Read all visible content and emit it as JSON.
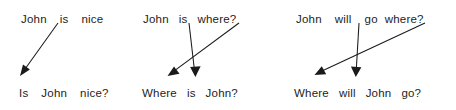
{
  "diagram": {
    "background_color": "#ffffff",
    "ink_color": "#1a1a1a",
    "groups": [
      {
        "id": "group-1",
        "transformation": "subject-auxiliary inversion",
        "source": {
          "full": "John is nice",
          "words": [
            "John",
            "is",
            "nice"
          ]
        },
        "target": {
          "full": "Is John nice?",
          "words": [
            "Is",
            "John",
            "nice?"
          ]
        },
        "arrows": [
          {
            "id": "g1-arrow-aux",
            "label": "is-to-front",
            "from_word": "is",
            "to_word": "Is",
            "from": [
              58,
              23
            ],
            "to": [
              21,
              74
            ]
          }
        ]
      },
      {
        "id": "group-2",
        "transformation": "wh-movement and subject-auxiliary inversion",
        "source": {
          "full": "John is where?",
          "words": [
            "John",
            "is",
            "where?"
          ]
        },
        "target": {
          "full": "Where is John?",
          "words": [
            "Where",
            "is",
            "John?"
          ]
        },
        "arrows": [
          {
            "id": "g2-arrow-aux",
            "label": "is-to-second",
            "from_word": "is",
            "to_word": "is",
            "from": [
              189,
              23
            ],
            "to": [
              195,
              76
            ]
          },
          {
            "id": "g2-arrow-wh",
            "label": "where-to-front",
            "from_word": "where?",
            "to_word": "Where",
            "from": [
              239,
              23
            ],
            "to": [
              168,
              76
            ]
          }
        ]
      },
      {
        "id": "group-3",
        "transformation": "wh-movement and subject-auxiliary inversion",
        "source": {
          "full": "John will go where?",
          "words": [
            "John",
            "will",
            "go",
            "where?"
          ]
        },
        "target": {
          "full": "Where will John go?",
          "words": [
            "Where",
            "will",
            "John",
            "go?"
          ]
        },
        "arrows": [
          {
            "id": "g3-arrow-aux",
            "label": "will-to-second",
            "from_word": "will",
            "to_word": "will",
            "from": [
              359,
              23
            ],
            "to": [
              356,
              76
            ]
          },
          {
            "id": "g3-arrow-wh",
            "label": "where-to-front",
            "from_word": "where?",
            "to_word": "Where",
            "from": [
              425,
              23
            ],
            "to": [
              315,
              76
            ]
          }
        ]
      }
    ]
  }
}
